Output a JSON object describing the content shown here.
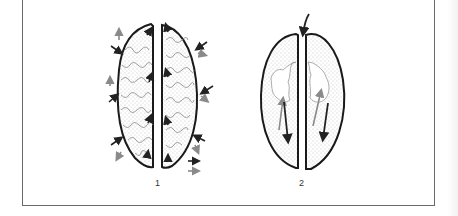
{
  "figure": {
    "panels": [
      {
        "id": "1",
        "label": "1",
        "description": "Seed halves with labyrinthine (ruminate) endosperm; black arrows inward, gray arrows outward at surface openings"
      },
      {
        "id": "2",
        "label": "2",
        "description": "Seed halves with central cavity; gray arrows up, black arrows down inside cavity; single arrow entering top gap"
      }
    ],
    "legend": {
      "arrows": [
        {
          "color": "#222222",
          "meaning": "inflow"
        },
        {
          "color": "#8a8a8a",
          "meaning": "outflow"
        }
      ]
    },
    "colors": {
      "outline": "#1a1a1a",
      "stipple": "#9a9a9a",
      "gray_arrow": "#8a8a8a",
      "black_arrow": "#222222",
      "frame": "#6a6a6a"
    }
  }
}
